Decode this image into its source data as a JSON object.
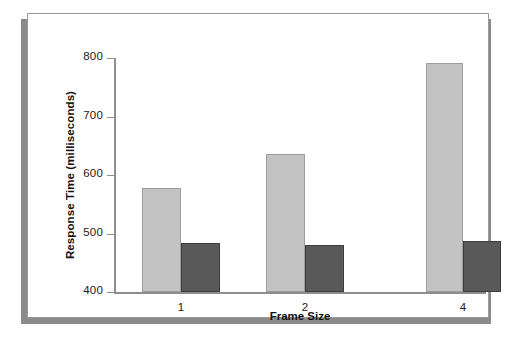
{
  "chart_data": {
    "type": "bar",
    "title": "",
    "xlabel": "Frame Size",
    "ylabel": "Response Time (milliseconds)",
    "categories": [
      "1",
      "2",
      "4"
    ],
    "series": [
      {
        "name": "series-1",
        "color": "#c3c3c3",
        "values": [
          578,
          636,
          791
        ]
      },
      {
        "name": "series-2",
        "color": "#595959",
        "values": [
          483,
          481,
          487
        ]
      }
    ],
    "ylim": [
      400,
      800
    ],
    "yticks": [
      400,
      500,
      600,
      700,
      800
    ],
    "ytick_labels": [
      "400",
      "500",
      "600",
      "700",
      "800"
    ],
    "grid": false,
    "legend": "none"
  },
  "axes": {
    "y_ticks": [
      {
        "label": "800",
        "value": 800
      },
      {
        "label": "700",
        "value": 700
      },
      {
        "label": "600",
        "value": 600
      },
      {
        "label": "500",
        "value": 500
      },
      {
        "label": "400",
        "value": 400
      }
    ],
    "x_ticks": [
      {
        "label": "1"
      },
      {
        "label": "2"
      },
      {
        "label": "4"
      }
    ]
  },
  "bars": [
    {
      "group": "1",
      "series": "series-1",
      "value": 578
    },
    {
      "group": "1",
      "series": "series-2",
      "value": 483
    },
    {
      "group": "2",
      "series": "series-1",
      "value": 636
    },
    {
      "group": "2",
      "series": "series-2",
      "value": 481
    },
    {
      "group": "4",
      "series": "series-1",
      "value": 791
    },
    {
      "group": "4",
      "series": "series-2",
      "value": 487
    }
  ],
  "style": {
    "light_bar_color": "#c3c3c3",
    "dark_bar_color": "#595959",
    "axis_color": "#8e8e8e",
    "panel_background": "#ffffff",
    "page_background": "#ffffff",
    "shadow_color": "#8b8b8b"
  }
}
